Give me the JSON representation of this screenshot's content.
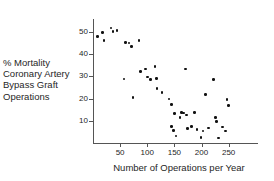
{
  "chart_data": {
    "type": "scatter",
    "title": "",
    "xlabel": "Number of Operations per Year",
    "ylabel": "% Mortality Coronary Artery Bypass Graft Operations",
    "ylabel_lines": [
      "% Mortality",
      "Coronary Artery",
      "Bypass Graft",
      "Operations"
    ],
    "xlim": [
      0,
      275
    ],
    "ylim": [
      0,
      56
    ],
    "xticks": [
      50,
      100,
      150,
      200,
      250
    ],
    "yticks": [
      10,
      20,
      30,
      40,
      50
    ],
    "grid": false,
    "legend": null,
    "marker": "filled-circle",
    "marker_color": "#111111",
    "axis_color": "#555555",
    "points": [
      {
        "x": 8,
        "y": 48.0
      },
      {
        "x": 18,
        "y": 49.8
      },
      {
        "x": 20,
        "y": 46.2
      },
      {
        "x": 33,
        "y": 51.8
      },
      {
        "x": 37,
        "y": 50.2
      },
      {
        "x": 44,
        "y": 50.6
      },
      {
        "x": 57,
        "y": 28.8
      },
      {
        "x": 60,
        "y": 45.2
      },
      {
        "x": 66,
        "y": 45.0
      },
      {
        "x": 71,
        "y": 43.4
      },
      {
        "x": 74,
        "y": 20.4
      },
      {
        "x": 85,
        "y": 46.2
      },
      {
        "x": 88,
        "y": 32.2
      },
      {
        "x": 97,
        "y": 33.4
      },
      {
        "x": 100,
        "y": 29.8
      },
      {
        "x": 106,
        "y": 28.6
      },
      {
        "x": 114,
        "y": 34.6
      },
      {
        "x": 117,
        "y": 29.0
      },
      {
        "x": 118,
        "y": 24.6
      },
      {
        "x": 127,
        "y": 22.8
      },
      {
        "x": 140,
        "y": 19.8
      },
      {
        "x": 145,
        "y": 17.4
      },
      {
        "x": 145,
        "y": 7.4
      },
      {
        "x": 148,
        "y": 5.6
      },
      {
        "x": 150,
        "y": 13.2
      },
      {
        "x": 153,
        "y": 3.2
      },
      {
        "x": 160,
        "y": 11.6
      },
      {
        "x": 163,
        "y": 13.8
      },
      {
        "x": 167,
        "y": 13.6
      },
      {
        "x": 171,
        "y": 33.4
      },
      {
        "x": 172,
        "y": 12.6
      },
      {
        "x": 174,
        "y": 6.6
      },
      {
        "x": 182,
        "y": 7.4
      },
      {
        "x": 187,
        "y": 13.8
      },
      {
        "x": 192,
        "y": 6.0
      },
      {
        "x": 199,
        "y": 2.4
      },
      {
        "x": 203,
        "y": 5.4
      },
      {
        "x": 207,
        "y": 21.8
      },
      {
        "x": 213,
        "y": 6.8
      },
      {
        "x": 222,
        "y": 28.6
      },
      {
        "x": 226,
        "y": 11.6
      },
      {
        "x": 228,
        "y": 9.8
      },
      {
        "x": 231,
        "y": 2.2
      },
      {
        "x": 239,
        "y": 7.2
      },
      {
        "x": 244,
        "y": 5.4
      },
      {
        "x": 247,
        "y": 19.6
      },
      {
        "x": 250,
        "y": 17.0
      }
    ]
  }
}
